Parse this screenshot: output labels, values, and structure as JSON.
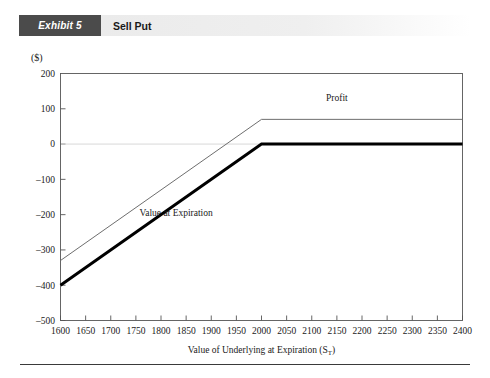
{
  "exhibit": {
    "tag": "Exhibit 5",
    "title": "Sell Put"
  },
  "axes": {
    "y_unit_label": "($)",
    "x_title_main": "Value of Underlying at Expiration (S",
    "x_title_sub": "T",
    "x_title_close": ")"
  },
  "colors": {
    "tag_background": "#4b4b4b",
    "tag_text": "#ffffff",
    "title_band": "#ebebeb",
    "axis": "#555555",
    "zero_gridline": "#d9d9d9",
    "value_line": "#000000",
    "profit_line": "#6e6e6e",
    "footer_rule": "#3a3a3a"
  },
  "chart_data": {
    "type": "line",
    "title": "Sell Put",
    "xlabel": "Value of Underlying at Expiration (S_T)",
    "ylabel": "($)",
    "xlim": [
      1600,
      2400
    ],
    "ylim": [
      -500,
      200
    ],
    "xticks": [
      1600,
      1650,
      1700,
      1750,
      1800,
      1850,
      1900,
      1950,
      2000,
      2050,
      2100,
      2150,
      2200,
      2250,
      2300,
      2350,
      2400
    ],
    "yticks": [
      200,
      100,
      0,
      -100,
      -200,
      -300,
      -400,
      -500
    ],
    "xtick_labels": [
      "1600",
      "1650",
      "1700",
      "1750",
      "1800",
      "1850",
      "1900",
      "1950",
      "2000",
      "2050",
      "2100",
      "2150",
      "2200",
      "2250",
      "2300",
      "2350",
      "2400"
    ],
    "ytick_labels": [
      "200",
      "100",
      "0",
      "-100",
      "-200",
      "-300",
      "-400",
      "-500"
    ],
    "grid": false,
    "zero_line": true,
    "strike_price": 2000,
    "option_premium": 70,
    "legend_position": "inline-annotation",
    "series": [
      {
        "name": "Value at Expiration",
        "style": "thick",
        "color": "#000000",
        "label_x": 1830,
        "label_y": -205,
        "x": [
          1600,
          2000,
          2400
        ],
        "values": [
          -400,
          0,
          0
        ]
      },
      {
        "name": "Profit",
        "style": "thin",
        "color": "#6e6e6e",
        "label_x": 2150,
        "label_y": 122,
        "x": [
          1600,
          2000,
          2400
        ],
        "values": [
          -330,
          70,
          70
        ]
      }
    ]
  }
}
